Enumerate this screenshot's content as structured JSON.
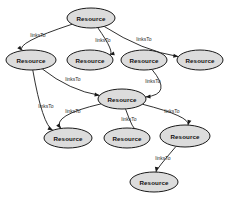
{
  "graph": {
    "type": "directed-graph",
    "node_label": "Resource",
    "edge_label": "linksTo",
    "node_fill_color": "#dcdcdc",
    "node_stroke_color": "#1a1a1a",
    "edge_color": "#1a1a1a",
    "background_color": "#ffffff",
    "nodes": [
      {
        "id": "n0",
        "label": "Resource",
        "cx": 91,
        "cy": 18,
        "rx": 24,
        "ry": 10
      },
      {
        "id": "n1",
        "label": "Resource",
        "cx": 31,
        "cy": 60,
        "rx": 25,
        "ry": 10
      },
      {
        "id": "n2",
        "label": "Resource",
        "cx": 90,
        "cy": 60,
        "rx": 23,
        "ry": 10
      },
      {
        "id": "n3",
        "label": "Resource",
        "cx": 144,
        "cy": 60,
        "rx": 23,
        "ry": 10
      },
      {
        "id": "n4",
        "label": "Resource",
        "cx": 200,
        "cy": 60,
        "rx": 23,
        "ry": 10
      },
      {
        "id": "n5",
        "label": "Resource",
        "cx": 122,
        "cy": 99,
        "rx": 24,
        "ry": 10
      },
      {
        "id": "n6",
        "label": "Resource",
        "cx": 68,
        "cy": 138,
        "rx": 24,
        "ry": 10
      },
      {
        "id": "n7",
        "label": "Resource",
        "cx": 127,
        "cy": 138,
        "rx": 23,
        "ry": 10
      },
      {
        "id": "n8",
        "label": "Resource",
        "cx": 185,
        "cy": 136,
        "rx": 25,
        "ry": 11
      },
      {
        "id": "n9",
        "label": "Resource",
        "cx": 154,
        "cy": 182,
        "rx": 24,
        "ry": 10
      }
    ],
    "edges": [
      {
        "from": "n0",
        "to": "n1",
        "label": "linksTo",
        "label_x": 38,
        "label_y": 35
      },
      {
        "from": "n0",
        "to": "n2",
        "label": "linksTo",
        "label_x": 103,
        "label_y": 40
      },
      {
        "from": "n0",
        "to": "n4",
        "label": "linksTo",
        "label_x": 144,
        "label_y": 39
      },
      {
        "from": "n1",
        "to": "n5",
        "label": "linksTo",
        "label_x": 73,
        "label_y": 79
      },
      {
        "from": "n1",
        "to": "n6",
        "label": "linksTo",
        "label_x": 46,
        "label_y": 106
      },
      {
        "from": "n3",
        "to": "n5",
        "label": "linksTo",
        "label_x": 153,
        "label_y": 81
      },
      {
        "from": "n5",
        "to": "n6",
        "label": "linksTo",
        "label_x": 73,
        "label_y": 111
      },
      {
        "from": "n5",
        "to": "n7",
        "label": "linksTo",
        "label_x": 129,
        "label_y": 119
      },
      {
        "from": "n5",
        "to": "n8",
        "label": "linksTo",
        "label_x": 172,
        "label_y": 111
      },
      {
        "from": "n8",
        "to": "n9",
        "label": "linksTo",
        "label_x": 163,
        "label_y": 158
      }
    ]
  }
}
